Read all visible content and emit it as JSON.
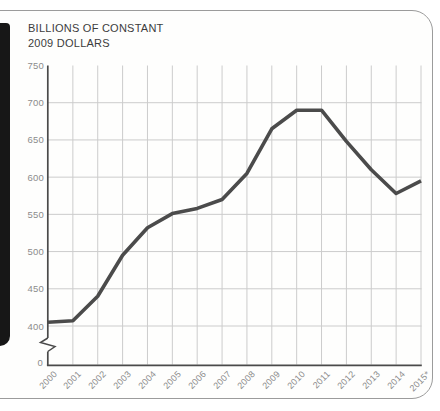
{
  "panel": {
    "border_color": "#9b9b9b",
    "background": "#fefefd",
    "spine_color": "#171717"
  },
  "chart_data": {
    "type": "line",
    "title": "BILLIONS OF CONSTANT 2009 DOLLARS",
    "title_lines": [
      "BILLIONS OF CONSTANT",
      "2009 DOLLARS"
    ],
    "categories": [
      "2000",
      "2001",
      "2002",
      "2003",
      "2004",
      "2005",
      "2006",
      "2007",
      "2008",
      "2009",
      "2010",
      "2011",
      "2012",
      "2013",
      "2014",
      "2015*"
    ],
    "series": [
      {
        "name": "spending-billions-constant-2009-dollars",
        "values": [
          405,
          407,
          440,
          495,
          532,
          551,
          558,
          570,
          605,
          665,
          690,
          690,
          648,
          610,
          578,
          595
        ]
      }
    ],
    "yticks": [
      750,
      700,
      650,
      600,
      550,
      500,
      450,
      400
    ],
    "y_origin_label": "0",
    "axis_break": true,
    "ylim_display": [
      400,
      750
    ],
    "grid": true,
    "legend": "none",
    "colors": {
      "line": "#4b4b4b",
      "grid": "#cccccc",
      "axis": "#4a4a4a",
      "tick_label": "#8c8c8c",
      "title": "#3c3c3c"
    }
  }
}
